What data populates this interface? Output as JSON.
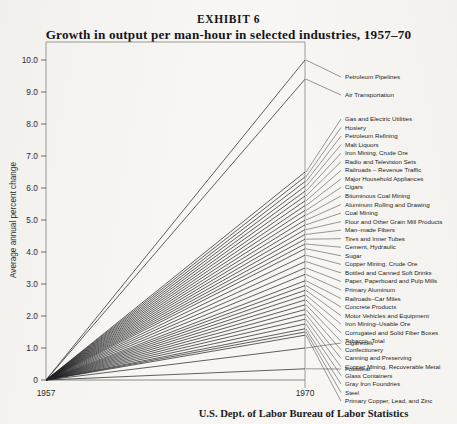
{
  "header": {
    "exhibit_label": "EXHIBIT 6",
    "title": "Growth in output per man-hour in selected industries, 1957–70"
  },
  "source": "U.S. Dept. of Labor Bureau of Labor Statistics",
  "axes": {
    "ylabel": "Average annual percent change",
    "yticks": [
      "10.0",
      "9.0",
      "8.0",
      "7.0",
      "6.0",
      "5.0",
      "4.0",
      "3.0",
      "2.0",
      "1.0",
      "0"
    ],
    "ytick_values": [
      10,
      9,
      8,
      7,
      6,
      5,
      4,
      3,
      2,
      1,
      0
    ],
    "xticks": [
      "1957",
      "1970"
    ],
    "xtick_values": [
      1957,
      1970
    ]
  },
  "chart_data": {
    "type": "line",
    "title": "Growth in output per man-hour in selected industries, 1957–70",
    "xlabel": "",
    "ylabel": "Average annual percent change",
    "xlim": [
      1957,
      1970
    ],
    "ylim": [
      0,
      10
    ],
    "grid": false,
    "legend": "right-labels",
    "x": [
      1957,
      1970
    ],
    "note": "Each industry is a straight ray from 0 at 1957 to its average annual percent change at 1970.",
    "series": [
      {
        "name": "Petroleum Pipelines",
        "values": [
          0,
          10.0
        ],
        "label_y": 10.0
      },
      {
        "name": "Air Transportation",
        "values": [
          0,
          9.4
        ],
        "label_y": 9.45
      },
      {
        "name": "Gas and Electric Utilities",
        "values": [
          0,
          6.5
        ],
        "label_y": 8.7
      },
      {
        "name": "Hosiery",
        "values": [
          0,
          6.35
        ],
        "label_y": 8.42
      },
      {
        "name": "Petroleum Refining",
        "values": [
          0,
          6.2
        ],
        "label_y": 8.14
      },
      {
        "name": "Malt Liquors",
        "values": [
          0,
          6.05
        ],
        "label_y": 7.86
      },
      {
        "name": "Iron Mining, Crude Ore",
        "values": [
          0,
          5.9
        ],
        "label_y": 7.58
      },
      {
        "name": "Radio and Television Sets",
        "values": [
          0,
          5.75
        ],
        "label_y": 7.3
      },
      {
        "name": "Railroads – Revenue Traffic",
        "values": [
          0,
          5.6
        ],
        "label_y": 7.02
      },
      {
        "name": "Major Household Appliances",
        "values": [
          0,
          5.45
        ],
        "label_y": 6.74
      },
      {
        "name": "Cigars",
        "values": [
          0,
          5.3
        ],
        "label_y": 6.46
      },
      {
        "name": "Bituminous Coal Mining",
        "values": [
          0,
          5.15
        ],
        "label_y": 6.18
      },
      {
        "name": "Aluminum Rolling and Drawing",
        "values": [
          0,
          5.0
        ],
        "label_y": 5.9
      },
      {
        "name": "Coal Mining",
        "values": [
          0,
          4.85
        ],
        "label_y": 5.62
      },
      {
        "name": "Flour and Other Grain Mill Products",
        "values": [
          0,
          4.7
        ],
        "label_y": 5.34
      },
      {
        "name": "Man–made Fibers",
        "values": [
          0,
          4.55
        ],
        "label_y": 5.06
      },
      {
        "name": "Tires and Inner Tubes",
        "values": [
          0,
          4.4
        ],
        "label_y": 4.78
      },
      {
        "name": "Cement, Hydraulic",
        "values": [
          0,
          4.25
        ],
        "label_y": 4.5
      },
      {
        "name": "Sugar",
        "values": [
          0,
          4.1
        ],
        "label_y": 4.22
      },
      {
        "name": "Copper Mining, Crude Ore",
        "values": [
          0,
          3.9
        ],
        "label_y": 3.94
      },
      {
        "name": "Bottled and Canned Soft Drinks",
        "values": [
          0,
          3.7
        ],
        "label_y": 3.66
      },
      {
        "name": "Paper, Paperboard and Pulp Mills",
        "values": [
          0,
          3.5
        ],
        "label_y": 3.38
      },
      {
        "name": "Primary Aluminum",
        "values": [
          0,
          3.3
        ],
        "label_y": 3.1
      },
      {
        "name": "Railroads–Car Miles",
        "values": [
          0,
          3.1
        ],
        "label_y": 2.82
      },
      {
        "name": "Concrete Products",
        "values": [
          0,
          2.95
        ],
        "label_y": 2.54
      },
      {
        "name": "Motor Vehicles and Equipment",
        "values": [
          0,
          2.8
        ],
        "label_y": 2.26
      },
      {
        "name": "Iron Mining–Usable Ore",
        "values": [
          0,
          2.65
        ],
        "label_y": 1.98
      },
      {
        "name": "Corrugated and Solid Fiber Boxes",
        "values": [
          0,
          2.5
        ],
        "label_y": 1.7
      },
      {
        "name": "Tobacco–Total",
        "values": [
          0,
          2.35
        ],
        "label_y": 1.42
      },
      {
        "name": "Confectionery",
        "values": [
          0,
          2.2
        ],
        "label_y": 1.14
      },
      {
        "name": "Canning and Preserving",
        "values": [
          0,
          2.05
        ],
        "label_y": 0.86
      },
      {
        "name": "Copper Mining, Recoverable Metal",
        "values": [
          0,
          1.9
        ],
        "label_y": 0.58
      },
      {
        "name": "Glass Containers",
        "values": [
          0,
          1.75
        ],
        "label_y": 0.3
      },
      {
        "name": "Gray Iron Foundries",
        "values": [
          0,
          1.6
        ],
        "label_y": 0.02
      },
      {
        "name": "Steel",
        "values": [
          0,
          1.5
        ],
        "label_y": -0.26
      },
      {
        "name": "Primary Copper, Lead, and Zinc",
        "values": [
          0,
          1.4
        ],
        "label_y": -0.54
      },
      {
        "name": "Cigarettes",
        "values": [
          0,
          1.0
        ],
        "label_y": -1.2
      },
      {
        "name": "Footwear",
        "values": [
          0,
          0.35
        ],
        "label_y": -2.0
      }
    ]
  }
}
